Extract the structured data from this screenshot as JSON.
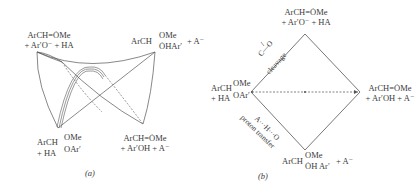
{
  "panel_a": {
    "caption": "(a)",
    "corners": {
      "top_left": [
        "ArCH=ȮMe",
        "+ Ar′O⁻ + HA"
      ],
      "top_right": {
        "main": "ArCH",
        "upper": "OMe",
        "lower": "ȮHAr′",
        "suffix": "+ A⁻"
      },
      "bottom_left": {
        "main": "ArCH",
        "upper": "OMe",
        "lower": "OAr′",
        "prefix": "+ HA"
      },
      "bottom_right": [
        "ArCH=ȮMe",
        "+ Ar′OH + A⁻"
      ]
    }
  },
  "panel_b": {
    "caption": "(b)",
    "corners": {
      "top": [
        "ArCH=ȮMe",
        "+ Ar′O⁻ + HA"
      ],
      "left": {
        "main": "ArCH",
        "upper": "OMe",
        "lower": "OAr′",
        "prefix": "+ HA"
      },
      "right": [
        "ArCH=ȮMe",
        "+ Ar′OH + A⁻"
      ],
      "bottom": {
        "main": "ArCH",
        "upper": "OMe",
        "lower": "ȮH Ar′",
        "suffix": "+ A⁻"
      }
    },
    "edge_labels": {
      "cleavage_bond": "C—O",
      "cleavage": "cleavage",
      "proton_bond": "A···H···O",
      "proton": "proton transfer"
    }
  },
  "colors": {
    "line": "#555555",
    "text": "#3a3a3a"
  }
}
